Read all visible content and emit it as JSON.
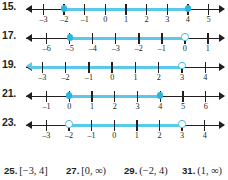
{
  "exercises": [
    {
      "number": "15.",
      "axis": {
        "min": -3.85,
        "max": 5.75
      },
      "left_arrow": true,
      "right_arrow": true,
      "ticks": [
        {
          "value": -3,
          "label": "–3"
        },
        {
          "value": -2,
          "label": "–2"
        },
        {
          "value": -1,
          "label": "–1"
        },
        {
          "value": 0,
          "label": "0"
        },
        {
          "value": 1,
          "label": "1"
        },
        {
          "value": 2,
          "label": "2"
        },
        {
          "value": 3,
          "label": "3"
        },
        {
          "value": 4,
          "label": "4"
        },
        {
          "value": 5,
          "label": "5"
        }
      ],
      "segment": {
        "from": -2,
        "to": 4,
        "left_end": "closed",
        "right_end": "closed",
        "extends_left": false,
        "extends_right": false
      }
    },
    {
      "number": "17.",
      "axis": {
        "min": -6.9,
        "max": 1.7
      },
      "left_arrow": true,
      "right_arrow": true,
      "ticks": [
        {
          "value": -6,
          "label": "–6"
        },
        {
          "value": -5,
          "label": "–5"
        },
        {
          "value": -4,
          "label": "–4"
        },
        {
          "value": -3,
          "label": "–3"
        },
        {
          "value": -2,
          "label": "–2"
        },
        {
          "value": -1,
          "label": "–1"
        },
        {
          "value": 0,
          "label": "0"
        },
        {
          "value": 1,
          "label": "1"
        }
      ],
      "segment": {
        "from": -5,
        "to": 0,
        "left_end": "closed",
        "right_end": "open",
        "extends_left": false,
        "extends_right": false
      }
    },
    {
      "number": "19.",
      "axis": {
        "min": -3.7,
        "max": 4.8
      },
      "left_arrow": true,
      "right_arrow": true,
      "ticks": [
        {
          "value": -3,
          "label": "–3"
        },
        {
          "value": -2,
          "label": "–2"
        },
        {
          "value": -1,
          "label": "–1"
        },
        {
          "value": 0,
          "label": "0"
        },
        {
          "value": 1,
          "label": "1"
        },
        {
          "value": 2,
          "label": "2"
        },
        {
          "value": 3,
          "label": "3"
        },
        {
          "value": 4,
          "label": "4"
        }
      ],
      "segment": {
        "from": -3.7,
        "to": 3,
        "left_end": "arrow",
        "right_end": "open",
        "extends_left": true,
        "extends_right": false
      }
    },
    {
      "number": "21.",
      "axis": {
        "min": -1.9,
        "max": 6.8
      },
      "left_arrow": true,
      "right_arrow": true,
      "ticks": [
        {
          "value": -1,
          "label": "–1"
        },
        {
          "value": 0,
          "label": "0"
        },
        {
          "value": 1,
          "label": "1"
        },
        {
          "value": 2,
          "label": "2"
        },
        {
          "value": 3,
          "label": "3"
        },
        {
          "value": 4,
          "label": "4"
        },
        {
          "value": 5,
          "label": "5"
        },
        {
          "value": 6,
          "label": "6"
        }
      ],
      "segment": {
        "from": 0,
        "to": 4,
        "left_end": "closed",
        "right_end": "closed",
        "extends_left": false,
        "extends_right": false
      }
    },
    {
      "number": "23.",
      "axis": {
        "min": -3.9,
        "max": 4.85
      },
      "left_arrow": true,
      "right_arrow": true,
      "ticks": [
        {
          "value": -3,
          "label": "–3"
        },
        {
          "value": -2,
          "label": "–2"
        },
        {
          "value": -1,
          "label": "–1"
        },
        {
          "value": 0,
          "label": "0"
        },
        {
          "value": 1,
          "label": "1"
        },
        {
          "value": 2,
          "label": "2"
        },
        {
          "value": 3,
          "label": "3"
        },
        {
          "value": 4,
          "label": "4"
        }
      ],
      "segment": {
        "from": -2,
        "to": 3,
        "left_end": "open",
        "right_end": "open",
        "extends_left": false,
        "extends_right": false
      }
    }
  ],
  "answers": [
    {
      "number": "25.",
      "value": "[−3, 4]"
    },
    {
      "number": "27.",
      "value": "[0, ∞)"
    },
    {
      "number": "29.",
      "value": "(−2, 4)"
    },
    {
      "number": "31.",
      "value": "(1, ∞)"
    }
  ],
  "colors": {
    "highlight": "#5ac8e8",
    "marker": "#2ab4e0",
    "axis": "#231f20",
    "text": "#231f20",
    "background": "#ffffff"
  }
}
